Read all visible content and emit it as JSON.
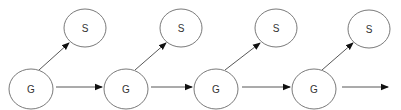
{
  "diagram": {
    "type": "state-transition chain",
    "colors": {
      "stroke": "#6a6a6a",
      "edge": "#444444",
      "text": "#333333",
      "background": "#ffffff"
    },
    "nodes": [
      {
        "id": "g1",
        "label": "G",
        "cx": 31,
        "cy": 89,
        "rx": 22,
        "ry": 20
      },
      {
        "id": "s1",
        "label": "S",
        "cx": 85,
        "cy": 28,
        "rx": 21,
        "ry": 19
      },
      {
        "id": "g2",
        "label": "G",
        "cx": 126,
        "cy": 89,
        "rx": 22,
        "ry": 20
      },
      {
        "id": "s2",
        "label": "S",
        "cx": 181,
        "cy": 28,
        "rx": 21,
        "ry": 19
      },
      {
        "id": "g3",
        "label": "G",
        "cx": 216,
        "cy": 89,
        "rx": 22,
        "ry": 20
      },
      {
        "id": "s3",
        "label": "S",
        "cx": 276,
        "cy": 28,
        "rx": 21,
        "ry": 19
      },
      {
        "id": "g4",
        "label": "G",
        "cx": 314,
        "cy": 89,
        "rx": 22,
        "ry": 20
      },
      {
        "id": "s4",
        "label": "S",
        "cx": 369,
        "cy": 29,
        "rx": 21,
        "ry": 19
      }
    ],
    "edges": [
      {
        "from": "g1",
        "to": "s1"
      },
      {
        "from": "g1",
        "to": "g2"
      },
      {
        "from": "g2",
        "to": "s2"
      },
      {
        "from": "g2",
        "to": "g3"
      },
      {
        "from": "g3",
        "to": "s3"
      },
      {
        "from": "g3",
        "to": "g4"
      },
      {
        "from": "g4",
        "to": "s4"
      },
      {
        "from": "g4",
        "to": "off-right"
      }
    ]
  }
}
